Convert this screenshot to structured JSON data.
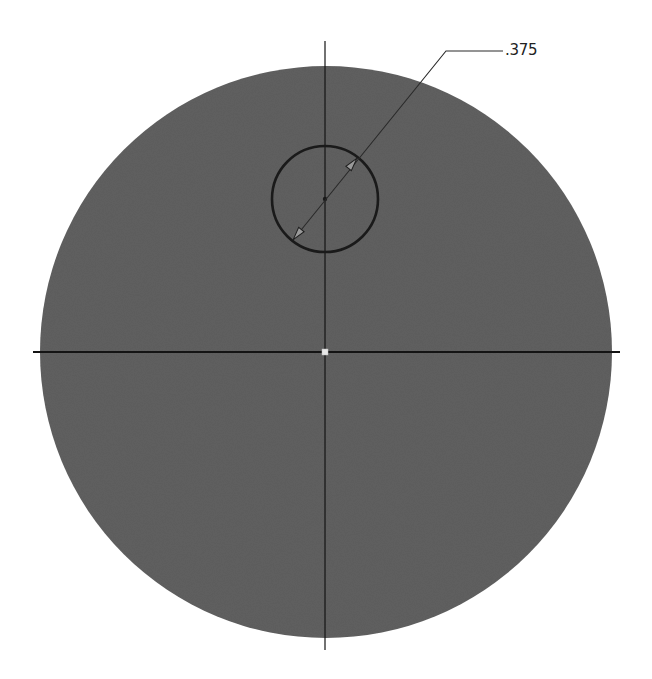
{
  "drawing": {
    "type": "cad-sketch",
    "background": "#ffffff",
    "face": {
      "shape": "circle",
      "cx": 326,
      "cy": 352,
      "r": 286,
      "fill": "#606060"
    },
    "hole": {
      "shape": "circle",
      "cx": 325,
      "cy": 199,
      "r": 53,
      "stroke": "#1a1a1a"
    },
    "centerlines": {
      "horizontal": {
        "y": 352,
        "x1": 33,
        "x2": 620
      },
      "vertical": {
        "x": 325,
        "y1": 41,
        "y2": 650
      },
      "color": "#141414"
    },
    "origin_point": {
      "x": 325,
      "y": 352,
      "color": "#e8e8e8"
    },
    "dimension": {
      "kind": "diameter",
      "value": ".375",
      "leader_start": {
        "x": 293,
        "y": 240
      },
      "leader_elbow": {
        "x": 446,
        "y": 51
      },
      "leader_end": {
        "x": 503,
        "y": 51
      },
      "color": "#2a2a2a"
    }
  }
}
